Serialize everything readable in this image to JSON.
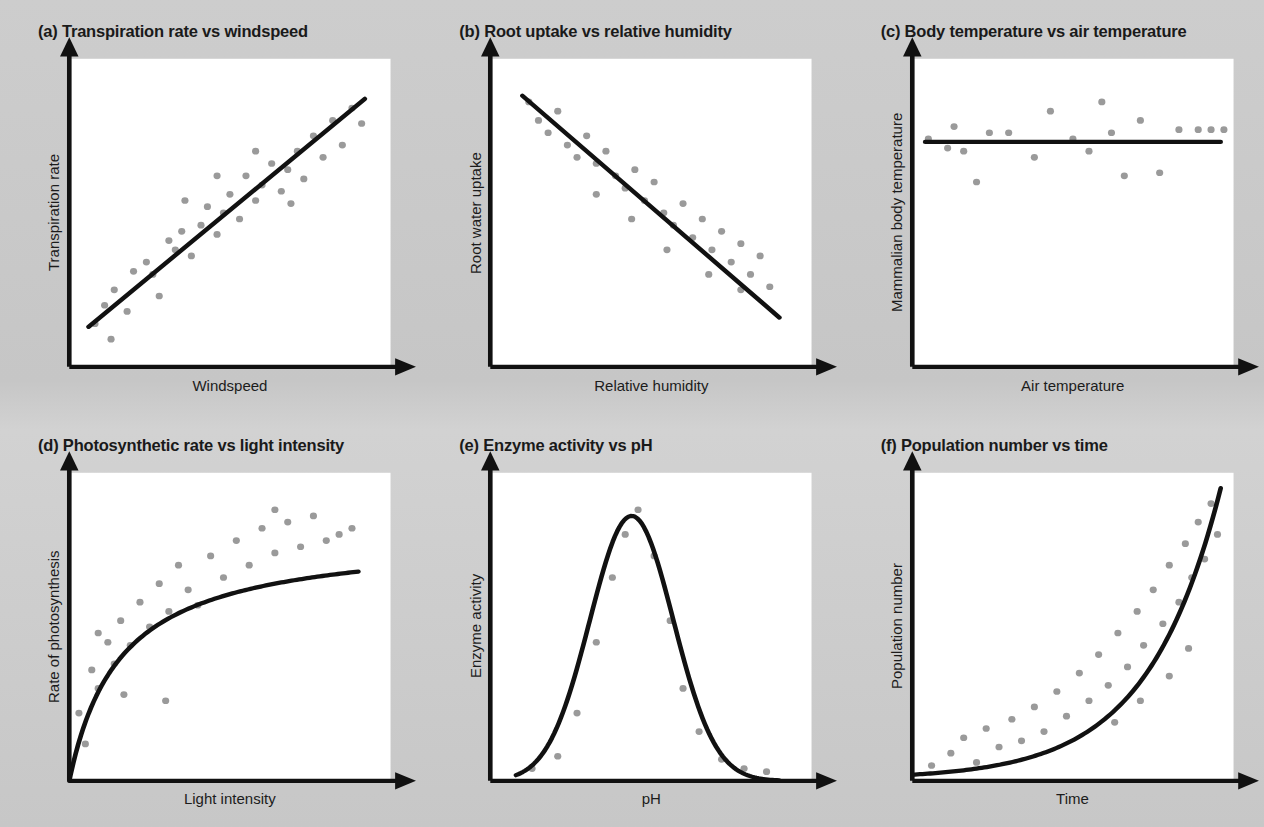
{
  "figure": {
    "background_color": "#c9c9c9",
    "plot_area_color": "#ffffff",
    "line_color": "#111111",
    "point_color": "#9a9a9a"
  },
  "chart_data": [
    {
      "type": "scatter",
      "panel": "a",
      "title": "(a) Transpiration rate vs windspeed",
      "xlabel": "Windspeed",
      "ylabel": "Transpiration rate",
      "relationship": "positive linear",
      "xlim": [
        0,
        100
      ],
      "ylim": [
        0,
        100
      ],
      "grid": false,
      "legend": "none",
      "fit_line": {
        "kind": "linear",
        "points": [
          [
            6,
            13
          ],
          [
            92,
            87
          ]
        ]
      },
      "points": [
        [
          8,
          14
        ],
        [
          13,
          9
        ],
        [
          11,
          20
        ],
        [
          14,
          25
        ],
        [
          18,
          18
        ],
        [
          20,
          31
        ],
        [
          24,
          34
        ],
        [
          26,
          30
        ],
        [
          28,
          23
        ],
        [
          31,
          41
        ],
        [
          33,
          38
        ],
        [
          35,
          44
        ],
        [
          38,
          36
        ],
        [
          41,
          46
        ],
        [
          43,
          52
        ],
        [
          46,
          43
        ],
        [
          48,
          50
        ],
        [
          50,
          56
        ],
        [
          53,
          48
        ],
        [
          55,
          62
        ],
        [
          58,
          54
        ],
        [
          60,
          59
        ],
        [
          63,
          66
        ],
        [
          66,
          57
        ],
        [
          68,
          64
        ],
        [
          71,
          70
        ],
        [
          73,
          61
        ],
        [
          76,
          75
        ],
        [
          79,
          68
        ],
        [
          82,
          80
        ],
        [
          85,
          72
        ],
        [
          88,
          84
        ],
        [
          91,
          79
        ],
        [
          58,
          70
        ],
        [
          46,
          62
        ],
        [
          69,
          53
        ],
        [
          36,
          54
        ]
      ]
    },
    {
      "type": "scatter",
      "panel": "b",
      "title": "(b) Root uptake vs relative humidity",
      "xlabel": "Relative humidity",
      "ylabel": "Root water uptake",
      "relationship": "negative linear",
      "xlim": [
        0,
        100
      ],
      "ylim": [
        0,
        100
      ],
      "grid": false,
      "legend": "none",
      "fit_line": {
        "kind": "linear",
        "points": [
          [
            10,
            88
          ],
          [
            90,
            16
          ]
        ]
      },
      "points": [
        [
          12,
          86
        ],
        [
          15,
          80
        ],
        [
          18,
          76
        ],
        [
          21,
          83
        ],
        [
          24,
          72
        ],
        [
          27,
          68
        ],
        [
          30,
          75
        ],
        [
          33,
          66
        ],
        [
          36,
          70
        ],
        [
          39,
          62
        ],
        [
          42,
          58
        ],
        [
          45,
          64
        ],
        [
          48,
          54
        ],
        [
          51,
          60
        ],
        [
          54,
          50
        ],
        [
          57,
          46
        ],
        [
          60,
          53
        ],
        [
          63,
          42
        ],
        [
          66,
          48
        ],
        [
          69,
          38
        ],
        [
          72,
          44
        ],
        [
          75,
          34
        ],
        [
          78,
          40
        ],
        [
          81,
          30
        ],
        [
          84,
          36
        ],
        [
          87,
          26
        ],
        [
          55,
          38
        ],
        [
          44,
          48
        ],
        [
          33,
          56
        ],
        [
          68,
          30
        ],
        [
          78,
          25
        ]
      ]
    },
    {
      "type": "scatter",
      "panel": "c",
      "title": "(c) Body temperature vs air temperature",
      "xlabel": "Air temperature",
      "ylabel": "Mammalian body temperature",
      "relationship": "no correlation (flat)",
      "xlim": [
        0,
        100
      ],
      "ylim": [
        0,
        100
      ],
      "grid": false,
      "legend": "none",
      "fit_line": {
        "kind": "linear",
        "points": [
          [
            4,
            73
          ],
          [
            96,
            73
          ]
        ]
      },
      "points": [
        [
          5,
          74
        ],
        [
          11,
          71
        ],
        [
          13,
          78
        ],
        [
          16,
          70
        ],
        [
          20,
          60
        ],
        [
          24,
          76
        ],
        [
          30,
          76
        ],
        [
          38,
          68
        ],
        [
          43,
          83
        ],
        [
          50,
          74
        ],
        [
          55,
          70
        ],
        [
          59,
          86
        ],
        [
          62,
          76
        ],
        [
          66,
          62
        ],
        [
          71,
          80
        ],
        [
          77,
          63
        ],
        [
          83,
          77
        ],
        [
          89,
          77
        ],
        [
          93,
          77
        ],
        [
          97,
          77
        ]
      ]
    },
    {
      "type": "scatter",
      "panel": "d",
      "title": "(d) Photosynthetic rate vs light intensity",
      "xlabel": "Light intensity",
      "ylabel": "Rate of photosynthesis",
      "relationship": "saturating / plateau",
      "xlim": [
        0,
        100
      ],
      "ylim": [
        0,
        100
      ],
      "grid": false,
      "legend": "none",
      "fit_line": {
        "kind": "saturating",
        "plateau": 80,
        "half_saturation": 16
      },
      "points": [
        [
          3,
          22
        ],
        [
          5,
          12
        ],
        [
          7,
          36
        ],
        [
          9,
          30
        ],
        [
          12,
          45
        ],
        [
          14,
          38
        ],
        [
          16,
          52
        ],
        [
          19,
          44
        ],
        [
          22,
          58
        ],
        [
          25,
          50
        ],
        [
          28,
          64
        ],
        [
          31,
          55
        ],
        [
          34,
          70
        ],
        [
          37,
          62
        ],
        [
          40,
          57
        ],
        [
          44,
          73
        ],
        [
          48,
          66
        ],
        [
          52,
          78
        ],
        [
          56,
          70
        ],
        [
          60,
          82
        ],
        [
          64,
          74
        ],
        [
          68,
          84
        ],
        [
          72,
          76
        ],
        [
          76,
          86
        ],
        [
          80,
          78
        ],
        [
          84,
          80
        ],
        [
          88,
          82
        ],
        [
          30,
          26
        ],
        [
          17,
          28
        ],
        [
          9,
          48
        ],
        [
          64,
          88
        ]
      ]
    },
    {
      "type": "scatter",
      "panel": "e",
      "title": "(e) Enzyme activity vs pH",
      "xlabel": "pH",
      "ylabel": "Enzyme activity",
      "relationship": "optimum / bell curve",
      "xlim": [
        0,
        100
      ],
      "ylim": [
        0,
        100
      ],
      "grid": false,
      "legend": "none",
      "fit_line": {
        "kind": "gaussian",
        "peak_x": 44,
        "peak_y": 86,
        "width": 13
      },
      "points": [
        [
          13,
          4
        ],
        [
          21,
          8
        ],
        [
          27,
          22
        ],
        [
          33,
          45
        ],
        [
          38,
          66
        ],
        [
          42,
          80
        ],
        [
          46,
          88
        ],
        [
          51,
          73
        ],
        [
          56,
          52
        ],
        [
          60,
          30
        ],
        [
          65,
          16
        ],
        [
          72,
          7
        ],
        [
          79,
          4
        ],
        [
          86,
          3
        ]
      ]
    },
    {
      "type": "scatter",
      "panel": "f",
      "title": "(f) Population number vs time",
      "xlabel": "Time",
      "ylabel": "Population number",
      "relationship": "exponential growth",
      "xlim": [
        0,
        100
      ],
      "ylim": [
        0,
        100
      ],
      "grid": false,
      "legend": "none",
      "fit_line": {
        "kind": "exponential",
        "base_y": 2,
        "max_y": 95,
        "curvature": 4.2
      },
      "points": [
        [
          6,
          5
        ],
        [
          12,
          9
        ],
        [
          16,
          14
        ],
        [
          20,
          6
        ],
        [
          23,
          17
        ],
        [
          27,
          11
        ],
        [
          31,
          20
        ],
        [
          34,
          13
        ],
        [
          38,
          24
        ],
        [
          41,
          16
        ],
        [
          45,
          29
        ],
        [
          48,
          21
        ],
        [
          52,
          35
        ],
        [
          55,
          26
        ],
        [
          58,
          41
        ],
        [
          61,
          31
        ],
        [
          64,
          48
        ],
        [
          67,
          37
        ],
        [
          70,
          55
        ],
        [
          72,
          44
        ],
        [
          75,
          62
        ],
        [
          78,
          51
        ],
        [
          80,
          70
        ],
        [
          83,
          58
        ],
        [
          85,
          77
        ],
        [
          87,
          66
        ],
        [
          89,
          84
        ],
        [
          91,
          72
        ],
        [
          93,
          90
        ],
        [
          95,
          80
        ],
        [
          80,
          34
        ],
        [
          86,
          43
        ],
        [
          71,
          26
        ],
        [
          63,
          19
        ]
      ]
    }
  ],
  "panels": [
    {
      "title": "(a) Transpiration rate vs windspeed",
      "xlabel": "Windspeed",
      "ylabel": "Transpiration rate"
    },
    {
      "title": "(b) Root uptake vs relative humidity",
      "xlabel": "Relative humidity",
      "ylabel": "Root water uptake"
    },
    {
      "title": "(c) Body temperature vs air temperature",
      "xlabel": "Air temperature",
      "ylabel": "Mammalian body temperature"
    },
    {
      "title": "(d) Photosynthetic rate vs light intensity",
      "xlabel": "Light intensity",
      "ylabel": "Rate of photosynthesis"
    },
    {
      "title": "(e) Enzyme activity vs pH",
      "xlabel": "pH",
      "ylabel": "Enzyme activity"
    },
    {
      "title": "(f) Population number vs time",
      "xlabel": "Time",
      "ylabel": "Population number"
    }
  ]
}
